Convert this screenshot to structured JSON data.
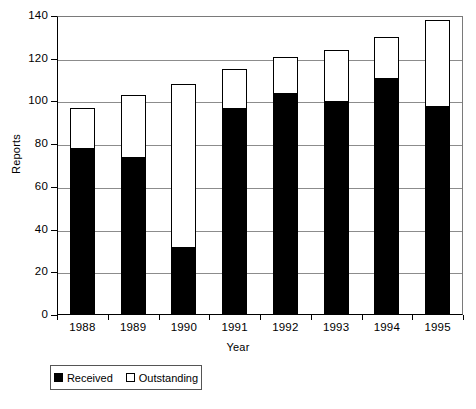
{
  "chart_data": {
    "type": "bar",
    "subtype": "stacked-vertical",
    "title": "",
    "xlabel": "Year",
    "ylabel": "Reports",
    "categories": [
      "1988",
      "1989",
      "1990",
      "1991",
      "1992",
      "1993",
      "1994",
      "1995"
    ],
    "series": [
      {
        "name": "Received",
        "color": "#000000",
        "fill": "solid-black",
        "values": [
          78,
          74,
          32,
          97,
          104,
          100,
          111,
          98
        ]
      },
      {
        "name": "Outstanding",
        "color": "#ffffff",
        "fill": "hollow-white",
        "values": [
          19,
          29,
          76,
          18,
          17,
          24,
          19,
          40
        ]
      }
    ],
    "totals": [
      97,
      103,
      108,
      115,
      121,
      124,
      130,
      138
    ],
    "ylim": [
      0,
      140
    ],
    "ytick_step": 20,
    "yticks": [
      0,
      20,
      40,
      60,
      80,
      100,
      120,
      140
    ],
    "ytick_labels": [
      "0",
      "20",
      "40",
      "60",
      "80",
      "100",
      "120",
      "140"
    ],
    "grid": true,
    "grid_axis": "y",
    "legend_position": "bottom-left",
    "legend_entries": [
      "Received",
      "Outstanding"
    ]
  },
  "axes": {
    "y_title": "Reports",
    "x_title": "Year"
  },
  "legend": {
    "items": [
      {
        "label": "Received",
        "swatch": "filled-square"
      },
      {
        "label": "Outstanding",
        "swatch": "hollow-square"
      }
    ]
  },
  "caption": {
    "text": ""
  },
  "colors": {
    "received": "#000000",
    "outstanding": "#ffffff",
    "axis": "#000000",
    "gridline": "#8c8c8c",
    "background": "#ffffff"
  }
}
